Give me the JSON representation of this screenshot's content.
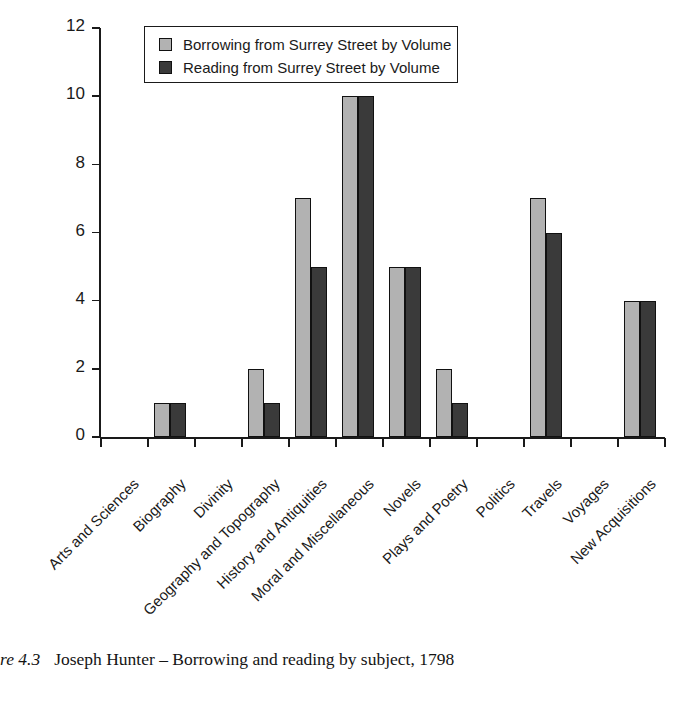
{
  "chart_data": {
    "type": "bar",
    "title": "",
    "xlabel": "",
    "ylabel": "",
    "ylim": [
      0,
      12
    ],
    "ytick_values": [
      0,
      2,
      4,
      6,
      8,
      10,
      12
    ],
    "ytick_labels": [
      "0",
      "2",
      "4",
      "6",
      "8",
      "10",
      "12"
    ],
    "grid": false,
    "legend_position": "top-center-inside",
    "categories": [
      "Arts and Sciences",
      "Biography",
      "Divinity",
      "Geography and Topography",
      "History and Antiquities",
      "Moral and Miscellaneous",
      "Novels",
      "Plays and Poetry",
      "Politics",
      "Travels",
      "Voyages",
      "New Acquisitions"
    ],
    "series": [
      {
        "name": "Borrowing from Surrey Street by Volume",
        "color": "#b2b2b2",
        "values": [
          0,
          1,
          0,
          2,
          7,
          10,
          5,
          2,
          0,
          7,
          0,
          4
        ]
      },
      {
        "name": "Reading from Surrey Street by Volume",
        "color": "#3a3a3a",
        "values": [
          0,
          1,
          0,
          1,
          5,
          10,
          5,
          1,
          0,
          6,
          0,
          4
        ]
      }
    ]
  },
  "caption": {
    "number": "re 4.3",
    "text": "Joseph Hunter – Borrowing and reading by subject, 1798"
  }
}
